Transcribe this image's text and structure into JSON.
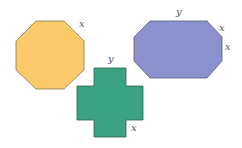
{
  "shapes": [
    {
      "name": "regular-octagon",
      "fill": "#F9C96A",
      "stroke": "#8A7A55",
      "points": "36,21 64,21 84,41 84,70 64,89 36,89 16,70 16,41",
      "labels": [
        {
          "text": "x",
          "x": 79,
          "y": 27
        }
      ]
    },
    {
      "name": "elongated-octagon",
      "fill": "#8A91CC",
      "stroke": "#5A5E80",
      "points": "150,21 207,21 222,37 222,61 207,78 150,78 134,61 134,37",
      "labels": [
        {
          "text": "y",
          "x": 176,
          "y": 15
        },
        {
          "text": "x",
          "x": 219,
          "y": 31
        },
        {
          "text": "x",
          "x": 225,
          "y": 50
        }
      ]
    },
    {
      "name": "cross",
      "fill": "#3BA384",
      "stroke": "#2A6650",
      "points": "94,68 126,68 126,86 143,86 143,120 126,120 126,137 94,137 94,120 77,120 77,86 94,86",
      "labels": [
        {
          "text": "y",
          "x": 108,
          "y": 62
        },
        {
          "text": "x",
          "x": 131,
          "y": 131
        }
      ]
    }
  ]
}
